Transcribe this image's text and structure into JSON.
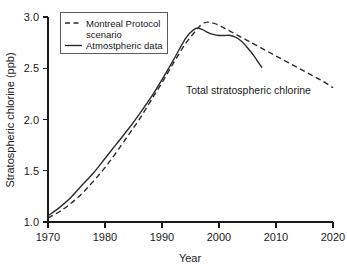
{
  "chart_data": {
    "type": "line",
    "title": "",
    "xlabel": "Year",
    "ylabel": "Stratospheric chlorine (ppb)",
    "xlim": [
      1970,
      2020
    ],
    "ylim": [
      1.0,
      3.0
    ],
    "xticks": [
      1970,
      1980,
      1990,
      2000,
      2010,
      2020
    ],
    "xtick_labels": [
      "1970",
      "1980",
      "1990",
      "2000",
      "2010",
      "2020"
    ],
    "yticks": [
      1.0,
      1.5,
      2.0,
      2.5,
      3.0
    ],
    "ytick_labels": [
      "1.0",
      "1.5",
      "2.0",
      "2.5",
      "3.0"
    ],
    "grid": false,
    "legend_position": "upper-left",
    "annotations": [
      {
        "text": "Total stratospheric chlorine",
        "x": 2001,
        "y": 2.42
      }
    ],
    "series": [
      {
        "name": "Montreal Protocol scenario",
        "style": "dashed",
        "color": "#2b2b2b",
        "x": [
          1970,
          1972,
          1974,
          1976,
          1978,
          1980,
          1982,
          1984,
          1986,
          1988,
          1990,
          1992,
          1994,
          1996,
          1997,
          1998,
          1999,
          2000,
          2001,
          2002,
          2003,
          2004,
          2005,
          2006,
          2008,
          2010,
          2012,
          2014,
          2016,
          2018,
          2020
        ],
        "y": [
          1.04,
          1.1,
          1.18,
          1.28,
          1.4,
          1.53,
          1.68,
          1.84,
          2.0,
          2.18,
          2.36,
          2.55,
          2.73,
          2.87,
          2.93,
          2.95,
          2.94,
          2.92,
          2.89,
          2.86,
          2.83,
          2.8,
          2.77,
          2.74,
          2.68,
          2.62,
          2.56,
          2.5,
          2.44,
          2.38,
          2.31
        ]
      },
      {
        "name": "Atmostpheric data",
        "style": "solid",
        "color": "#2b2b2b",
        "x": [
          1970,
          1972,
          1974,
          1976,
          1978,
          1980,
          1982,
          1984,
          1986,
          1988,
          1990,
          1992,
          1994,
          1995,
          1996,
          1997,
          1998,
          1999,
          2000,
          2001,
          2002,
          2003,
          2004,
          2005,
          2006,
          2007,
          2007.5
        ],
        "y": [
          1.06,
          1.14,
          1.24,
          1.36,
          1.48,
          1.62,
          1.76,
          1.9,
          2.05,
          2.21,
          2.39,
          2.58,
          2.78,
          2.85,
          2.89,
          2.88,
          2.85,
          2.83,
          2.82,
          2.82,
          2.82,
          2.8,
          2.76,
          2.7,
          2.63,
          2.55,
          2.51
        ]
      }
    ]
  },
  "legend": {
    "entries": [
      {
        "label_line1": "Montreal Protocol",
        "label_line2": "scenario",
        "style": "dashed"
      },
      {
        "label_line1": "Atmostpheric data",
        "label_line2": "",
        "style": "solid"
      }
    ]
  }
}
